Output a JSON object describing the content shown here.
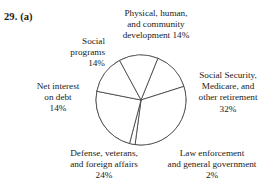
{
  "figure": {
    "problem_number": "29.",
    "part_label": "(a)",
    "problem_header": "29.  (a)",
    "top_bleed_artifact": "",
    "stroke_color": "#3b3b3b",
    "fill_color": "#ffffff",
    "text_color": "#1a1a1a"
  },
  "chart_data": {
    "type": "pie",
    "title": "",
    "subtitle": "",
    "xlabel": "",
    "ylabel": "",
    "legend_position": "none",
    "grid": false,
    "units": "percent",
    "total": 100,
    "start_angle_deg": -68,
    "direction": "clockwise",
    "center": {
      "x": 141,
      "y": 100
    },
    "radius": 45,
    "categories": [
      "Physical, human, and community development",
      "Social Security, Medicare, and other retirement",
      "Law enforcement and general government",
      "Defense, veterans, and foreign affairs",
      "Net interest on debt",
      "Social programs"
    ],
    "values": [
      14,
      32,
      2,
      24,
      14,
      14
    ],
    "slices": [
      {
        "label": "Physical, human, and community development",
        "value": 14,
        "value_text": "14%",
        "label_lines": [
          "Physical, human,",
          "and community",
          "development 14%"
        ],
        "label_position": "top"
      },
      {
        "label": "Social Security, Medicare, and other retirement",
        "value": 32,
        "value_text": "32%",
        "label_lines": [
          "Social Security,",
          "Medicare, and",
          "other retirement",
          "32%"
        ],
        "label_position": "right"
      },
      {
        "label": "Law enforcement and general government",
        "value": 2,
        "value_text": "2%",
        "label_lines": [
          "Law enforcement",
          "and general government",
          "2%"
        ],
        "label_position": "bottom-right"
      },
      {
        "label": "Defense, veterans, and foreign affairs",
        "value": 24,
        "value_text": "24%",
        "label_lines": [
          "Defense, veterans,",
          "and foreign affairs",
          "24%"
        ],
        "label_position": "bottom-left"
      },
      {
        "label": "Net interest on debt",
        "value": 14,
        "value_text": "14%",
        "label_lines": [
          "Net interest",
          "on debt",
          "14%"
        ],
        "label_position": "left"
      },
      {
        "label": "Social programs",
        "value": 14,
        "value_text": "14%",
        "label_lines": [
          "Social",
          "programs",
          "14%"
        ],
        "label_position": "top-left"
      }
    ]
  },
  "labels": {
    "physical": "Physical, human,\nand community\ndevelopment 14%",
    "social_programs": "Social\nprograms\n14%",
    "net_interest": "Net interest\non debt\n14%",
    "social_security": "Social Security,\nMedicare, and\nother retirement\n32%",
    "defense": "Defense, veterans,\nand foreign affairs\n24%",
    "law_enforcement": "Law enforcement\nand general government\n2%"
  }
}
